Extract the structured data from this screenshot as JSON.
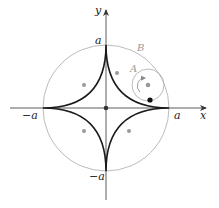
{
  "diagram": {
    "axes": {
      "x_label": "x",
      "y_label": "y"
    },
    "tick_labels": {
      "pos_x": "a",
      "neg_x": "−a",
      "pos_y": "a",
      "neg_y": "−a"
    },
    "circles": {
      "large_label": "B",
      "small_label": "A"
    },
    "colors": {
      "curve": "#1a1a1a",
      "circle": "#aaaaaa",
      "axis": "#333333",
      "marker": "#999999"
    }
  }
}
